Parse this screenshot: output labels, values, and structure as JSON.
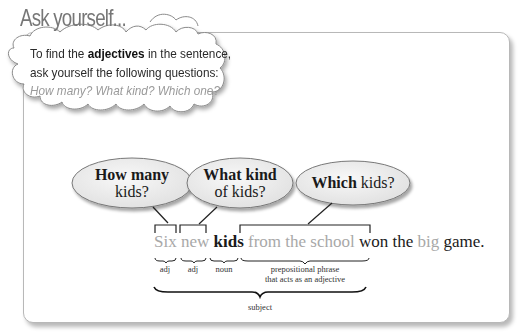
{
  "header": {
    "title": "Ask yourself..."
  },
  "callout": {
    "text_before": "To find the ",
    "bold_word": "adjectives",
    "text_after": " in the sentence, ask yourself the following questions: ",
    "questions_italic": "How many? What kind? Which one?"
  },
  "bubbles": [
    {
      "bold": "How many",
      "normal": "kids?"
    },
    {
      "bold": "What kind",
      "normal": "of kids?"
    },
    {
      "bold": "Which",
      "normal": " kids?"
    }
  ],
  "sentence": {
    "words": [
      {
        "text": "Six",
        "style": "gray"
      },
      {
        "text": "new",
        "style": "gray"
      },
      {
        "text": "kids",
        "style": "bold"
      },
      {
        "text": "from the school",
        "style": "gray"
      },
      {
        "text": "won the",
        "style": "normal"
      },
      {
        "text": "big",
        "style": "gray"
      },
      {
        "text": "game.",
        "style": "normal"
      }
    ]
  },
  "labels": {
    "six": "adj",
    "new": "adj",
    "kids": "noun",
    "phrase_line1": "prepositional phrase",
    "phrase_line2": "that acts as an adjective",
    "subject": "subject"
  },
  "colors": {
    "highlight_gray": "#a8a8a8",
    "text_dark": "#1a1a1a",
    "bubble_fill": "#ececec",
    "border": "#b8b8b8"
  }
}
